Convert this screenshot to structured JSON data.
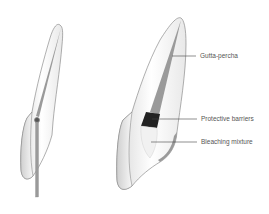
{
  "diagram": {
    "figures": [
      {
        "id": "tooth-left",
        "description": "Tooth cross-section with instrument inserted in canal"
      },
      {
        "id": "tooth-right",
        "description": "Tooth cross-section showing internal bleaching layers"
      }
    ],
    "labels": [
      {
        "text": "Gutta-percha",
        "x": 200,
        "y": 56
      },
      {
        "text": "Protective barriers",
        "x": 201,
        "y": 116
      },
      {
        "text": "Bleaching mixture",
        "x": 201,
        "y": 139
      }
    ],
    "colors": {
      "outline": "#6b6b6b",
      "canal": "#9a9a9a",
      "barrier": "#222222",
      "tooth_fill": "#f4f4f4",
      "label_text": "#555555"
    }
  }
}
